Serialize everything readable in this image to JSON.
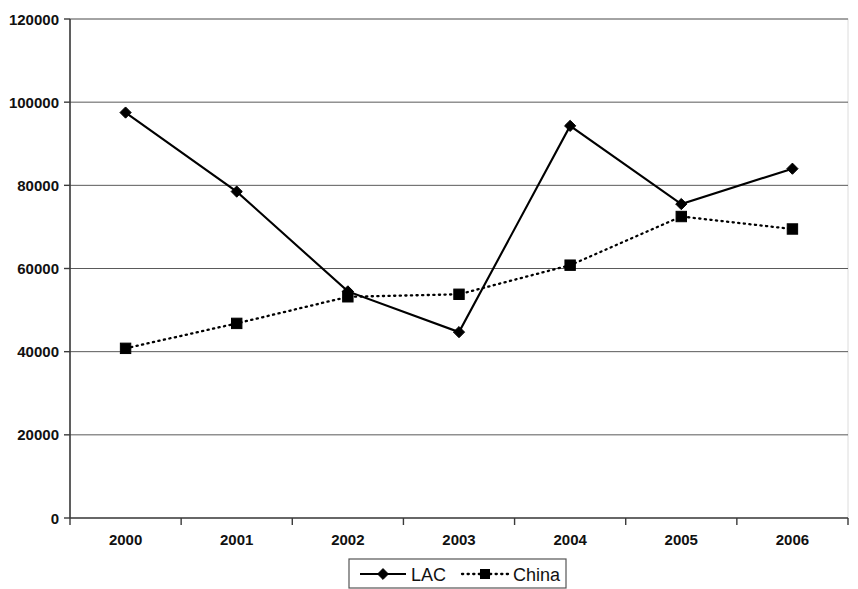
{
  "chart_data": {
    "type": "line",
    "title": "",
    "subtitle": "",
    "xlabel": "",
    "ylabel": "",
    "categories": [
      "2000",
      "2001",
      "2002",
      "2003",
      "2004",
      "2005",
      "2006"
    ],
    "x": [
      2000,
      2001,
      2002,
      2003,
      2004,
      2005,
      2006
    ],
    "series": [
      {
        "name": "LAC",
        "values": [
          97500,
          78500,
          54500,
          44700,
          94300,
          75500,
          84000
        ],
        "marker": "diamond",
        "line_style": "solid",
        "color": "#000000"
      },
      {
        "name": "China",
        "values": [
          40800,
          46800,
          53200,
          53800,
          60800,
          72500,
          69500
        ],
        "marker": "square",
        "line_style": "dotted",
        "color": "#000000"
      }
    ],
    "ylim": [
      0,
      120000
    ],
    "yticks": [
      0,
      20000,
      40000,
      60000,
      80000,
      100000,
      120000
    ],
    "ytick_labels": [
      "0",
      "20000",
      "40000",
      "60000",
      "80000",
      "100000",
      "120000"
    ],
    "xtick_labels": [
      "2000",
      "2001",
      "2002",
      "2003",
      "2004",
      "2005",
      "2006"
    ],
    "grid": "horizontal",
    "legend_position": "bottom-center",
    "legend_entries": [
      "LAC",
      "China"
    ]
  },
  "axis": {
    "y_labels": [
      "120000",
      "100000",
      "80000",
      "60000",
      "40000",
      "20000",
      "0"
    ],
    "x_labels": [
      "2000",
      "2001",
      "2002",
      "2003",
      "2004",
      "2005",
      "2006"
    ]
  },
  "legend": {
    "items": [
      {
        "label": "LAC",
        "marker": "diamond",
        "style": "solid"
      },
      {
        "label": "China",
        "marker": "square",
        "style": "dotted"
      }
    ]
  },
  "background_ghost_text": [
    " ",
    " ",
    " "
  ],
  "colors": {
    "series_lac": "#000000",
    "series_china": "#000000",
    "gridline": "#5a5a5a",
    "axis": "#3a3a3a",
    "background": "#ffffff"
  }
}
